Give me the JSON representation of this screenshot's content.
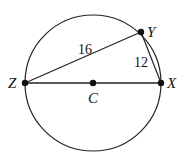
{
  "diagram": {
    "circle": {
      "center_label": "C",
      "cx": 93,
      "cy": 83,
      "r": 68
    },
    "points": [
      {
        "id": "Z",
        "label": "Z",
        "x": 25,
        "y": 83
      },
      {
        "id": "X",
        "label": "X",
        "x": 161,
        "y": 83
      },
      {
        "id": "Y",
        "label": "Y",
        "x": 141,
        "y": 32
      },
      {
        "id": "C",
        "label": "C",
        "x": 93,
        "y": 83
      }
    ],
    "segments": [
      {
        "from": "Z",
        "to": "Y",
        "length_label": "16"
      },
      {
        "from": "Y",
        "to": "X",
        "length_label": "12"
      },
      {
        "from": "Z",
        "to": "X",
        "length_label": ""
      }
    ],
    "labels": {
      "Z": "Z",
      "X": "X",
      "Y": "Y",
      "C": "C",
      "zy_length": "16",
      "yx_length": "12"
    }
  }
}
